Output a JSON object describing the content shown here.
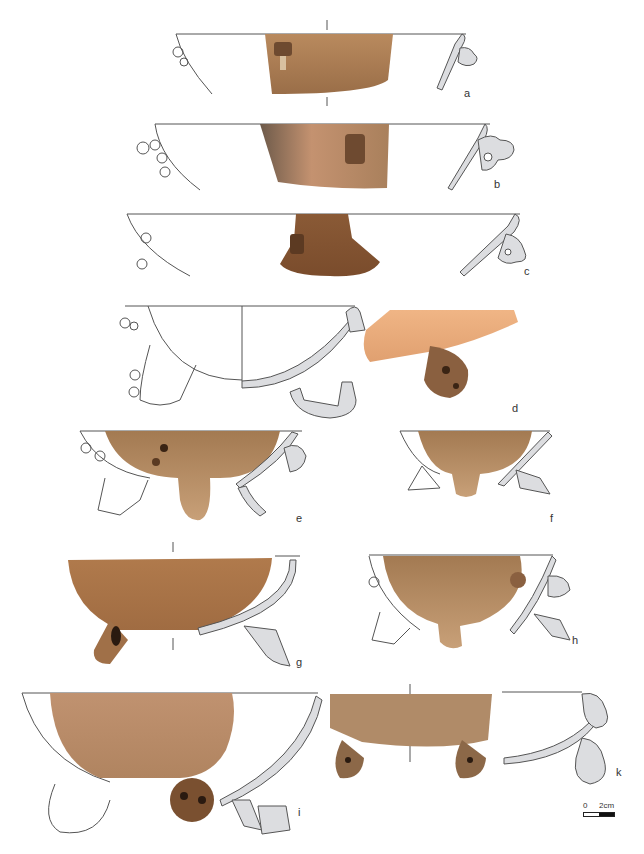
{
  "figure": {
    "type": "archaeological ceramic plate",
    "colors": {
      "outline": "#555555",
      "section_fill": "#dcdde0",
      "clay_light": "#c99a6a",
      "clay_mid": "#a87850",
      "clay_dark": "#7a5234",
      "clay_orange": "#e8aa78"
    },
    "vessels": [
      {
        "id": "a",
        "label": "a"
      },
      {
        "id": "b",
        "label": "b"
      },
      {
        "id": "c",
        "label": "c"
      },
      {
        "id": "d",
        "label": "d"
      },
      {
        "id": "e",
        "label": "e"
      },
      {
        "id": "f",
        "label": "f"
      },
      {
        "id": "g",
        "label": "g"
      },
      {
        "id": "h",
        "label": "h"
      },
      {
        "id": "i",
        "label": "i"
      },
      {
        "id": "k",
        "label": "k"
      }
    ],
    "scale_bar": {
      "start_label": "0",
      "end_label": "2cm"
    }
  }
}
